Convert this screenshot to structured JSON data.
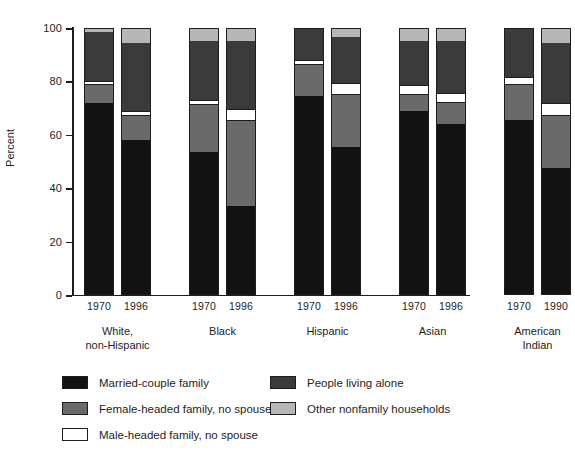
{
  "chart_data": {
    "type": "bar",
    "subtype": "stacked-bar-100-percent",
    "title": "",
    "xlabel": "",
    "ylabel": "Percent",
    "ylim": [
      0,
      100
    ],
    "yticks": [
      0,
      20,
      40,
      60,
      80,
      100
    ],
    "ytick_labels": [
      "0",
      "20",
      "40",
      "60",
      "80",
      "100"
    ],
    "grid": false,
    "legend_position": "bottom",
    "series": [
      {
        "name": "Married-couple family",
        "color": "#121212",
        "values": [
          72.0,
          58.0,
          53.5,
          33.5,
          74.5,
          55.5,
          69.0,
          64.0,
          65.5,
          47.5
        ]
      },
      {
        "name": "Female-headed family, no spouse",
        "color": "#6a6a6a",
        "values": [
          6.5,
          9.0,
          17.5,
          31.5,
          11.5,
          19.5,
          6.0,
          8.0,
          13.0,
          19.5
        ]
      },
      {
        "name": "Male-headed family, no spouse",
        "color": "#ffffff",
        "values": [
          1.5,
          2.0,
          2.0,
          4.5,
          2.0,
          4.5,
          3.5,
          3.5,
          3.0,
          5.0
        ]
      },
      {
        "name": "People living alone",
        "color": "#3b3b3b",
        "values": [
          18.5,
          25.5,
          22.0,
          25.5,
          11.5,
          17.0,
          16.5,
          19.5,
          18.0,
          22.5
        ]
      },
      {
        "name": "Other nonfamily households",
        "color": "#b7b7b7",
        "values": [
          1.5,
          5.5,
          5.0,
          5.0,
          0.5,
          3.5,
          5.0,
          5.0,
          0.5,
          5.5
        ]
      }
    ],
    "categories": [
      "1970",
      "1996",
      "1970",
      "1996",
      "1970",
      "1996",
      "1970",
      "1996",
      "1970",
      "1990"
    ],
    "groups": [
      {
        "label_line1": "White,",
        "label_line2": "non-Hispanic",
        "years": [
          "1970",
          "1996"
        ]
      },
      {
        "label_line1": "Black",
        "label_line2": "",
        "years": [
          "1970",
          "1996"
        ]
      },
      {
        "label_line1": "Hispanic",
        "label_line2": "",
        "years": [
          "1970",
          "1996"
        ]
      },
      {
        "label_line1": "Asian",
        "label_line2": "",
        "years": [
          "1970",
          "1996"
        ]
      },
      {
        "label_line1": "American",
        "label_line2": "Indian",
        "years": [
          "1970",
          "1990"
        ]
      }
    ],
    "legend": [
      {
        "label": "Married-couple family",
        "color": "#121212",
        "swatch": "sw-married"
      },
      {
        "label": "People living alone",
        "color": "#3b3b3b",
        "swatch": "sw-alone"
      },
      {
        "label": "Female-headed family, no spouse",
        "color": "#6a6a6a",
        "swatch": "sw-female"
      },
      {
        "label": "Other nonfamily households",
        "color": "#b7b7b7",
        "swatch": "sw-other"
      },
      {
        "label": "Male-headed family, no spouse",
        "color": "#ffffff",
        "swatch": "sw-male"
      }
    ]
  },
  "axis": {
    "y_title": "Percent"
  }
}
